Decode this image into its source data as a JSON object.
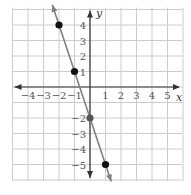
{
  "chart_data": {
    "type": "line",
    "title": "",
    "xlabel": "x",
    "ylabel": "y",
    "xlim": [
      -5,
      6
    ],
    "ylim": [
      -6,
      5
    ],
    "grid": true,
    "x_ticks": [
      "-4",
      "-3",
      "-2",
      "-1",
      "1",
      "2",
      "3",
      "4",
      "5"
    ],
    "y_ticks": [
      "4",
      "3",
      "2",
      "1",
      "-2",
      "-3",
      "-4",
      "-5"
    ],
    "line": {
      "slope": -3,
      "intercept": -2,
      "equation": "y = -3x - 2"
    },
    "points": [
      {
        "x": -2,
        "y": 4
      },
      {
        "x": -1,
        "y": 1
      },
      {
        "x": 0,
        "y": -2
      },
      {
        "x": 1,
        "y": -5
      }
    ],
    "colors": {
      "line": "#808080",
      "point": "#111111",
      "grid": "#cccccc",
      "axis": "#333333"
    }
  }
}
